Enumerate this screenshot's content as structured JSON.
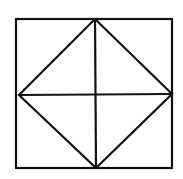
{
  "diagram": {
    "type": "geometric-figure",
    "stroke_color": "#111111",
    "background": "#ffffff",
    "square": {
      "x1": 16,
      "y1": 19,
      "x2": 172,
      "y2": 168
    },
    "midpoints": {
      "top": [
        95,
        19
      ],
      "right": [
        172,
        94
      ],
      "bottom": [
        96,
        168
      ],
      "left": [
        19,
        95
      ]
    }
  }
}
